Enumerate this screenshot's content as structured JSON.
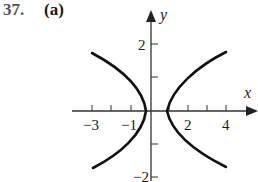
{
  "problem": {
    "number": "37.",
    "part": "(a)"
  },
  "axes": {
    "x_label": "x",
    "y_label": "y"
  },
  "x_ticks": [
    {
      "value": -3,
      "label": "−3"
    },
    {
      "value": -2,
      "label": ""
    },
    {
      "value": -1,
      "label": "−1"
    },
    {
      "value": 2,
      "label": "2"
    },
    {
      "value": 3,
      "label": ""
    },
    {
      "value": 4,
      "label": "4"
    }
  ],
  "y_ticks": [
    {
      "value": 2,
      "label": "2"
    },
    {
      "value": 1,
      "label": ""
    },
    {
      "value": -1,
      "label": ""
    },
    {
      "value": -2,
      "label": "−2"
    }
  ],
  "curve": {
    "description": "Hyperbola opening left/right with vertices at x=0 and x=1, centered at x=0.5",
    "color": "#111111"
  }
}
